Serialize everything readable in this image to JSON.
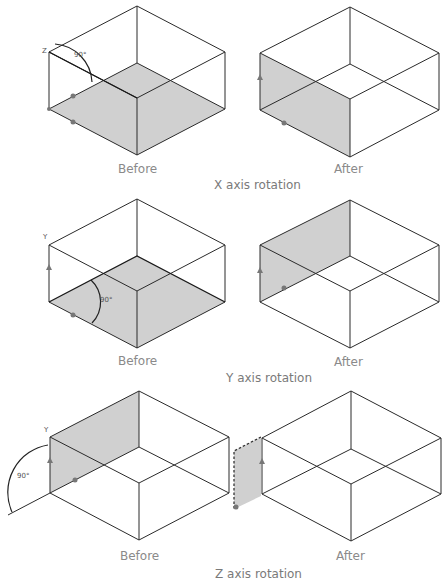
{
  "rows": [
    {
      "title": "X axis rotation",
      "before_label": "Before",
      "after_label": "After",
      "angle_label": "90°",
      "axis_label": "Z"
    },
    {
      "title": "Y axis rotation",
      "before_label": "Before",
      "after_label": "After",
      "angle_label": "90°",
      "axis_label": "Y"
    },
    {
      "title": "Z axis rotation",
      "before_label": "Before",
      "after_label": "After",
      "angle_label": "90°",
      "axis_label": "Y"
    }
  ],
  "colors": {
    "face_fill": "#d0d0d0",
    "line": "#2a2a2a",
    "caption": "#8a8a8a"
  }
}
